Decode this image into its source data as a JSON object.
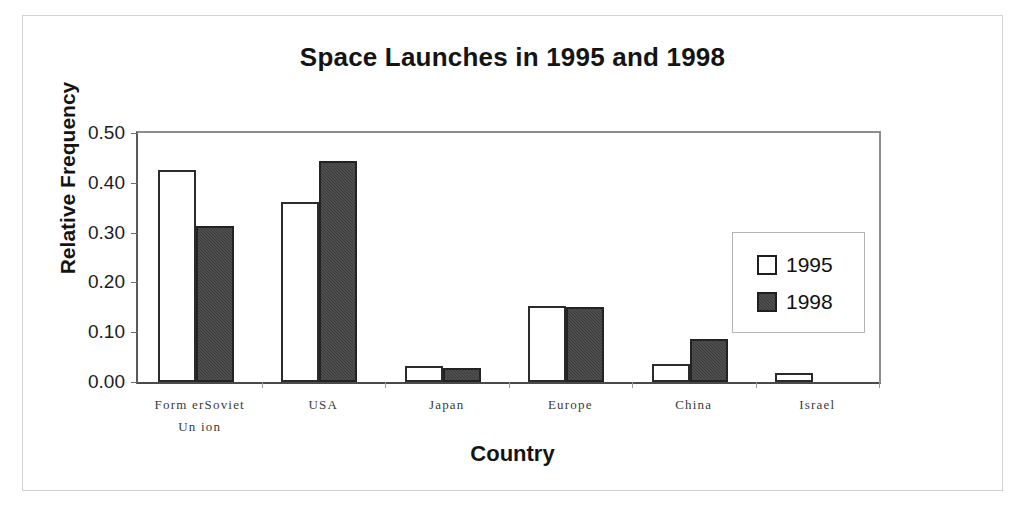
{
  "chart_data": {
    "type": "bar",
    "title": "Space Launches in 1995 and 1998",
    "xlabel": "Country",
    "ylabel": "Relative Frequency",
    "categories": [
      "Former Soviet Union",
      "USA",
      "Japan",
      "Europe",
      "China",
      "Israel"
    ],
    "category_labels": [
      {
        "line1": "Form erSoviet",
        "line2": "Un ion"
      },
      {
        "line1": "USA",
        "line2": ""
      },
      {
        "line1": "Japan",
        "line2": ""
      },
      {
        "line1": "Europe",
        "line2": ""
      },
      {
        "line1": "China",
        "line2": ""
      },
      {
        "line1": "Israel",
        "line2": ""
      }
    ],
    "series": [
      {
        "name": "1995",
        "color": "#ffffff",
        "values": [
          0.426,
          0.361,
          0.032,
          0.153,
          0.036,
          0.018
        ]
      },
      {
        "name": "1998",
        "color": "#3b3b3b",
        "values": [
          0.313,
          0.444,
          0.028,
          0.15,
          0.086,
          0.0
        ]
      }
    ],
    "ylim": [
      0.0,
      0.5
    ],
    "yticks": [
      "0.00",
      "0.10",
      "0.20",
      "0.30",
      "0.40",
      "0.50"
    ],
    "ytick_values": [
      0.0,
      0.1,
      0.2,
      0.3,
      0.4,
      0.5
    ],
    "grid": false,
    "legend_position": "center-right",
    "legend": [
      {
        "label": "1995",
        "swatch": "white-square"
      },
      {
        "label": "1998",
        "swatch": "dark-square"
      }
    ]
  }
}
